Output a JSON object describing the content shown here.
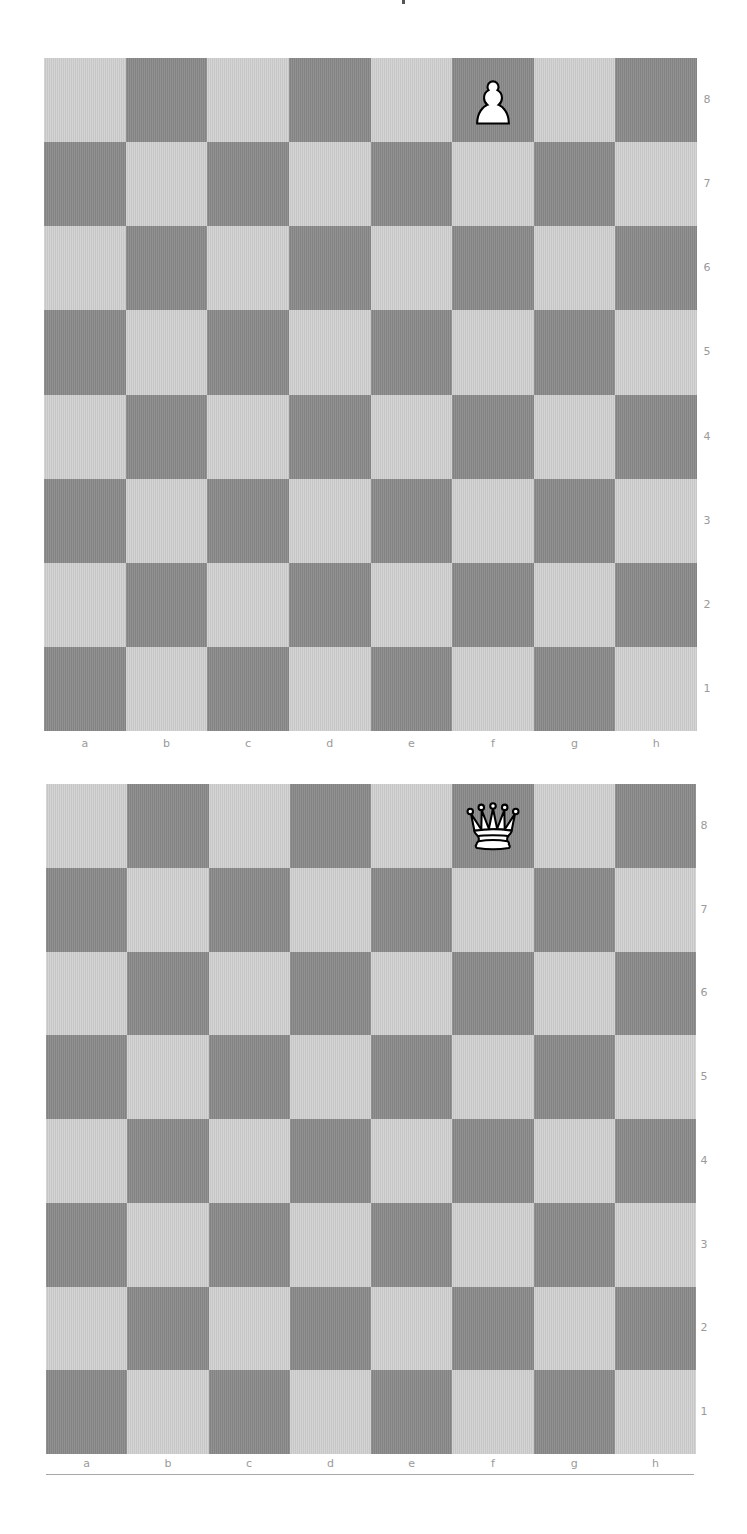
{
  "boards": [
    {
      "id": "board-1",
      "piece": {
        "name": "pawn",
        "color": "white",
        "square": "f8",
        "glyph": "♙"
      },
      "files": [
        "a",
        "b",
        "c",
        "d",
        "e",
        "f",
        "g",
        "h"
      ],
      "ranks": [
        "8",
        "7",
        "6",
        "5",
        "4",
        "3",
        "2",
        "1"
      ]
    },
    {
      "id": "board-2",
      "piece": {
        "name": "queen",
        "color": "white",
        "square": "f8",
        "glyph": "♕"
      },
      "files": [
        "a",
        "b",
        "c",
        "d",
        "e",
        "f",
        "g",
        "h"
      ],
      "ranks": [
        "8",
        "7",
        "6",
        "5",
        "4",
        "3",
        "2",
        "1"
      ]
    }
  ],
  "colors": {
    "light_square": "#cfcfcf",
    "dark_square": "#8b8b8b",
    "label": "#9a9a9a"
  }
}
